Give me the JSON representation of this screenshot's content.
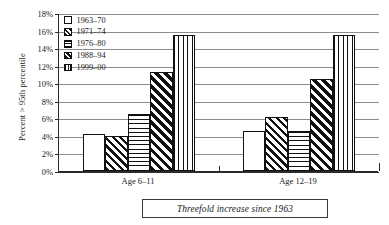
{
  "chart_data": {
    "type": "bar",
    "title": "",
    "xlabel": "",
    "ylabel": "Percent > 95th percentile",
    "ylim": [
      0,
      18
    ],
    "ytick_labels": [
      "0%",
      "2%",
      "4%",
      "6%",
      "8%",
      "10%",
      "12%",
      "14%",
      "16%",
      "18%"
    ],
    "ytick_values": [
      0,
      2,
      4,
      6,
      8,
      10,
      12,
      14,
      16,
      18
    ],
    "grid": true,
    "legend_position": "top-left",
    "categories": [
      "Age 6-11",
      "Age 12-19"
    ],
    "series": [
      {
        "name": "1963-70",
        "pattern": "plain",
        "values": [
          4.2,
          4.6
        ]
      },
      {
        "name": "1971-74",
        "pattern": "diag",
        "values": [
          4.0,
          6.1
        ]
      },
      {
        "name": "1976-80",
        "pattern": "horz",
        "values": [
          6.5,
          4.6
        ]
      },
      {
        "name": "1988-94",
        "pattern": "diag-dense",
        "values": [
          11.3,
          10.5
        ]
      },
      {
        "name": "1999-00",
        "pattern": "vert",
        "values": [
          15.5,
          15.5
        ]
      }
    ],
    "annotation": "Threefold increase since 1963"
  },
  "legend": {
    "items": [
      {
        "label": "1963–70"
      },
      {
        "label": "1971–74"
      },
      {
        "label": "1976–80"
      },
      {
        "label": "1988–94"
      },
      {
        "label": "1999–00"
      }
    ]
  },
  "axes": {
    "y_title": "Percent > 95th percentile",
    "y_ticks": [
      "18%",
      "16%",
      "14%",
      "12%",
      "10%",
      "8%",
      "6%",
      "4%",
      "2%",
      "0%"
    ],
    "x_groups": [
      "Age 6–11",
      "Age 12–19"
    ]
  },
  "caption": {
    "text": "Threefold increase since 1963"
  }
}
